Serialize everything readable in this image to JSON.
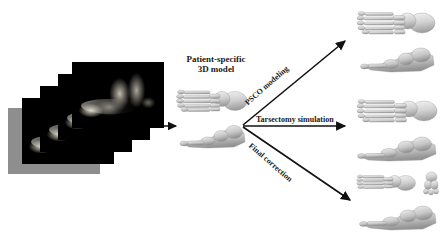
{
  "figure": {
    "background_color": "#ffffff",
    "kind": "surgical-planning-workflow-diagram"
  },
  "stages": {
    "input": {
      "name": "ct-slice-stack",
      "slice_count": 5,
      "description": "Stack of grayscale CT scan slices of a foot"
    },
    "model": {
      "caption": "Patient-specific\n3D model",
      "view_count": 2,
      "views": [
        "dorsal",
        "lateral"
      ]
    },
    "outputs": [
      {
        "id": "psco",
        "arrow_label": "PSCO modeling",
        "image_count": 2,
        "views": [
          "dorsal",
          "lateral"
        ]
      },
      {
        "id": "tarsectomy",
        "arrow_label": "Tarsectomy simulation",
        "image_count": 2,
        "views": [
          "dorsal",
          "lateral"
        ]
      },
      {
        "id": "final",
        "arrow_label": "Final correction",
        "image_count": 3,
        "views": [
          "dorsal",
          "anterior",
          "lateral"
        ]
      }
    ]
  },
  "arrows": {
    "ct_to_model": "straight-right-arrow",
    "branch_top": "diagonal-up-right-arrow",
    "branch_middle": "straight-right-arrow",
    "branch_bottom": "diagonal-down-right-arrow",
    "color": "#111111"
  },
  "colors": {
    "arrow": "#111111",
    "text": "#1a1a1a",
    "bone_light": "#e8e8e8",
    "bone_mid": "#b9b9b9",
    "bone_dark": "#8a8a8a",
    "ct_background": "#000000"
  }
}
